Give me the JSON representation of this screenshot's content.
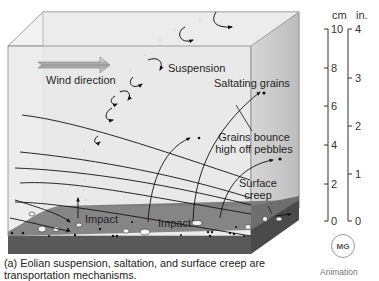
{
  "figure": {
    "labels": {
      "wind_direction": "Wind direction",
      "suspension": "Suspension",
      "saltating_grains": "Saltating grains",
      "grains_bounce_line1": "Grains bounce",
      "grains_bounce_line2": "high off pebbles",
      "surface_line1": "Surface",
      "surface_line2": "creep",
      "impact_left": "Impact",
      "impact_right": "Impact"
    },
    "scale": {
      "cm_unit": "cm",
      "in_unit": "in.",
      "cm_ticks": [
        "10",
        "8",
        "6",
        "4",
        "2",
        "0"
      ],
      "in_ticks": [
        "4",
        "3",
        "2",
        "1",
        "0"
      ]
    },
    "caption_line1": "(a) Eolian suspension, saltation, and surface creep are",
    "caption_line2": "transportation mechanisms.",
    "badge": {
      "logo_text": "MG",
      "label": "Animation"
    },
    "colors": {
      "box_face": "#e6e6e6",
      "box_top": "#f0f0f0",
      "box_side": "#cfcfcf",
      "ground_top": "#7c7c7c",
      "ground_front": "#555555",
      "lines": "#1a1a1a"
    }
  }
}
